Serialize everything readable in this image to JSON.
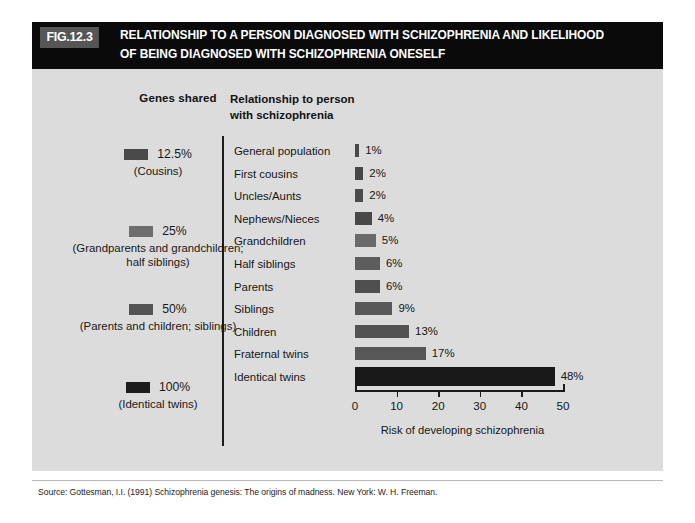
{
  "figure": {
    "tag": "FIG.12.3",
    "title_line1": "RELATIONSHIP TO A PERSON DIAGNOSED WITH SCHIZOPHRENIA AND LIKELIHOOD",
    "title_line2": "OF BEING DIAGNOSED WITH SCHIZOPHRENIA ONESELF",
    "source": "Source: Gottesman, I.I. (1991) Schizophrenia genesis: The origins of madness. New York: W. H. Freeman."
  },
  "headers": {
    "genes_shared": "Genes shared",
    "relationship": "Relationship to person with schizophrenia"
  },
  "genes_groups": [
    {
      "percent": "12.5%",
      "detail": "(Cousins)",
      "color": "#4a4a4a",
      "top": 78
    },
    {
      "percent": "25%",
      "detail": "(Grandparents and grandchildren; half siblings)",
      "color": "#6e6e6e",
      "top": 155
    },
    {
      "percent": "50%",
      "detail": "(Parents and children; siblings)",
      "color": "#545454",
      "top": 233
    },
    {
      "percent": "100%",
      "detail": "(Identical twins)",
      "color": "#1d1d1d",
      "top": 311
    }
  ],
  "colors": {
    "banner_bg": "#0a0a0a",
    "panel_bg": "#dcdcdc",
    "bar_default": "#4f4f4f",
    "bar_highlight": "#1a1a1a",
    "axis": "#1b1b1b"
  },
  "chart_data": {
    "type": "bar",
    "orientation": "horizontal",
    "title": "RELATIONSHIP TO A PERSON DIAGNOSED WITH SCHIZOPHRENIA AND LIKELIHOOD OF BEING DIAGNOSED WITH SCHIZOPHRENIA ONESELF",
    "xlabel": "Risk of developing schizophrenia",
    "ylabel": "Relationship to person with schizophrenia",
    "xlim": [
      0,
      50
    ],
    "xticks": [
      0,
      10,
      20,
      30,
      40,
      50
    ],
    "xtick_labels": [
      "0",
      "10",
      "20",
      "30",
      "40",
      "50"
    ],
    "grid": false,
    "legend": false,
    "units": "percent",
    "categories": [
      "General population",
      "First cousins",
      "Uncles/Aunts",
      "Nephews/Nieces",
      "Grandchildren",
      "Half siblings",
      "Parents",
      "Siblings",
      "Children",
      "Fraternal twins",
      "Identical twins"
    ],
    "values": [
      1,
      2,
      2,
      4,
      5,
      6,
      6,
      9,
      13,
      17,
      48
    ],
    "value_labels": [
      "1%",
      "2%",
      "2%",
      "4%",
      "5%",
      "6%",
      "6%",
      "9%",
      "13%",
      "17%",
      "48%"
    ],
    "bar_colors": [
      "#4a4a4a",
      "#474747",
      "#4b4b4b",
      "#484848",
      "#6a6a6a",
      "#5d5d5d",
      "#4f4f4f",
      "#585858",
      "#535353",
      "#575757",
      "#181818"
    ]
  }
}
